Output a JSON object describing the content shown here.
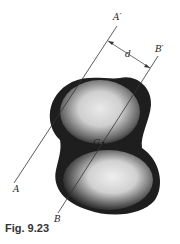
{
  "figure": {
    "caption": "Fig. 9.23",
    "labels": {
      "a_prime": "A′",
      "a": "A",
      "b_prime": "B′",
      "b": "B",
      "distance": "d",
      "centroid": "G"
    },
    "colors": {
      "line": "#333333",
      "shape_dark": "#1a1a1a",
      "shape_light": "#f2f2f2",
      "caption": "#333333"
    }
  }
}
